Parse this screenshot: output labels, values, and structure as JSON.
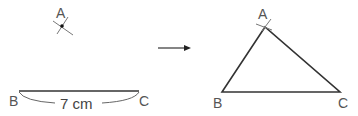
{
  "diagram": {
    "step1": {
      "point_a_label": "A",
      "point_b_label": "B",
      "point_c_label": "C",
      "segment_length_label": "7 cm"
    },
    "arrow": "right-arrow",
    "step2": {
      "vertex_a_label": "A",
      "vertex_b_label": "B",
      "vertex_c_label": "C"
    },
    "colors": {
      "line": "#333333",
      "label": "#555555",
      "arc_mark": "#777777"
    }
  }
}
